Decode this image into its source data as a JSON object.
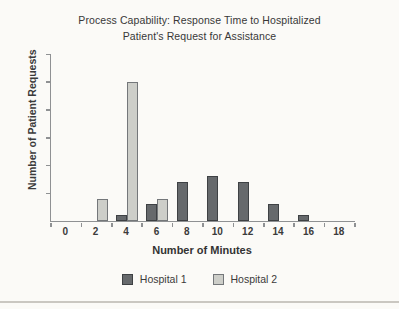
{
  "title": {
    "lines": [
      "Process Capability: Response Time to Hospitalized",
      "Patient's Request for Assistance"
    ]
  },
  "chart_data": {
    "type": "bar",
    "title": "Process Capability: Response Time to Hospitalized Patient's Request for Assistance",
    "categories": [
      "0",
      "2",
      "4",
      "6",
      "8",
      "10",
      "12",
      "14",
      "16",
      "18"
    ],
    "series": [
      {
        "name": "Hospital 1",
        "values": [
          0,
          0,
          1,
          3,
          7,
          8,
          7,
          3,
          1,
          0
        ],
        "fill": "#66696c",
        "border": "#3e4144"
      },
      {
        "name": "Hospital 2",
        "values": [
          0,
          4,
          25,
          4,
          0,
          0,
          0,
          0,
          0,
          0
        ],
        "fill": "#cdcec9",
        "border": "#74777a"
      }
    ],
    "xlabel": "Number of Minutes",
    "ylabel": "Number of Patient Requests",
    "ylim": [
      0,
      30
    ],
    "ytick_interval": 5,
    "yticks_labeled": false,
    "grid": false,
    "legend_position": "bottom",
    "colors": {
      "background": "#fbfaf7",
      "axis": "#8f9193",
      "text": "#3b3b3b",
      "bottom_rule": "#cac7c1"
    }
  }
}
